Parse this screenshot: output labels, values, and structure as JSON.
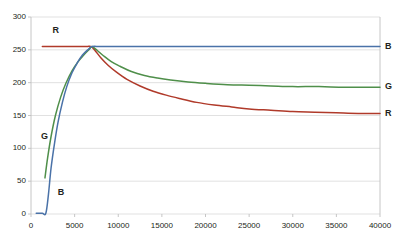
{
  "chart_data": {
    "type": "line",
    "title": "",
    "xlabel": "",
    "ylabel": "",
    "xlim": [
      0,
      40000
    ],
    "ylim": [
      0,
      300
    ],
    "grid": "horizontal",
    "legend_position": "inline-right",
    "xticks": [
      0,
      5000,
      10000,
      15000,
      20000,
      25000,
      30000,
      35000,
      40000
    ],
    "xtick_labels": [
      "0",
      "5000",
      "10000",
      "15000",
      "20000",
      "25000",
      "30000",
      "35000",
      "40000"
    ],
    "yticks": [
      0,
      50,
      100,
      150,
      200,
      250,
      300
    ],
    "ytick_labels": [
      "0",
      "50",
      "100",
      "150",
      "200",
      "250",
      "300"
    ],
    "colors": {
      "R": "#b03a2a",
      "G": "#4f8f4a",
      "B": "#4a72a8",
      "gridline": "#d9d9d9",
      "axis": "#bfbfbf",
      "text": "#231f20"
    },
    "series": [
      {
        "name": "R",
        "label": "R",
        "color": "#b03a2a",
        "inline_label_left": "R",
        "inline_label_right": "R",
        "points": [
          [
            1300,
            255
          ],
          [
            2500,
            255
          ],
          [
            4000,
            255
          ],
          [
            5500,
            255
          ],
          [
            6400,
            255
          ],
          [
            6900,
            255
          ],
          [
            7400,
            248
          ],
          [
            8000,
            238
          ],
          [
            8800,
            227
          ],
          [
            9800,
            216
          ],
          [
            11000,
            205
          ],
          [
            12500,
            195
          ],
          [
            14000,
            187
          ],
          [
            15500,
            181
          ],
          [
            17000,
            176
          ],
          [
            19000,
            170
          ],
          [
            21000,
            166
          ],
          [
            23000,
            163
          ],
          [
            25000,
            160
          ],
          [
            27500,
            158
          ],
          [
            30000,
            156
          ],
          [
            32500,
            155
          ],
          [
            35000,
            154
          ],
          [
            37500,
            153
          ],
          [
            40000,
            153
          ]
        ]
      },
      {
        "name": "G",
        "label": "G",
        "color": "#4f8f4a",
        "inline_label_left": "G",
        "inline_label_right": "G",
        "points": [
          [
            1600,
            55
          ],
          [
            1900,
            85
          ],
          [
            2300,
            118
          ],
          [
            2800,
            150
          ],
          [
            3400,
            178
          ],
          [
            4000,
            199
          ],
          [
            4700,
            218
          ],
          [
            5400,
            232
          ],
          [
            6100,
            243
          ],
          [
            6700,
            251
          ],
          [
            7000,
            255
          ],
          [
            7600,
            249
          ],
          [
            8300,
            241
          ],
          [
            9200,
            232
          ],
          [
            10200,
            225
          ],
          [
            11500,
            217
          ],
          [
            13000,
            211
          ],
          [
            14500,
            207
          ],
          [
            16000,
            204
          ],
          [
            18000,
            201
          ],
          [
            20000,
            199
          ],
          [
            22500,
            197
          ],
          [
            25000,
            196
          ],
          [
            27500,
            195
          ],
          [
            30000,
            194
          ],
          [
            33000,
            194
          ],
          [
            36000,
            193
          ],
          [
            40000,
            193
          ]
        ]
      },
      {
        "name": "B",
        "label": "B",
        "color": "#4a72a8",
        "inline_label_left": "B",
        "inline_label_right": "B",
        "points": [
          [
            600,
            1
          ],
          [
            1300,
            1
          ],
          [
            1700,
            1
          ],
          [
            2000,
            30
          ],
          [
            2300,
            70
          ],
          [
            2700,
            108
          ],
          [
            3100,
            140
          ],
          [
            3600,
            170
          ],
          [
            4100,
            194
          ],
          [
            4700,
            215
          ],
          [
            5300,
            230
          ],
          [
            5900,
            242
          ],
          [
            6500,
            250
          ],
          [
            7000,
            255
          ],
          [
            8000,
            255
          ],
          [
            10000,
            255
          ],
          [
            14000,
            255
          ],
          [
            18000,
            255
          ],
          [
            24000,
            255
          ],
          [
            30000,
            255
          ],
          [
            36000,
            255
          ],
          [
            40000,
            255
          ]
        ]
      }
    ],
    "annotations": [
      {
        "text": "R",
        "x": 2800,
        "y": 278,
        "series": "R",
        "placement": "inside-left-top"
      },
      {
        "text": "G",
        "x": 1500,
        "y": 118,
        "series": "G",
        "placement": "inside-left"
      },
      {
        "text": "B",
        "x": 3400,
        "y": 32,
        "series": "B",
        "placement": "inside-left-bottom"
      },
      {
        "text": "B",
        "x": 40000,
        "y": 255,
        "series": "B",
        "placement": "outside-right"
      },
      {
        "text": "G",
        "x": 40000,
        "y": 193,
        "series": "G",
        "placement": "outside-right"
      },
      {
        "text": "R",
        "x": 40000,
        "y": 153,
        "series": "R",
        "placement": "outside-right"
      }
    ]
  }
}
